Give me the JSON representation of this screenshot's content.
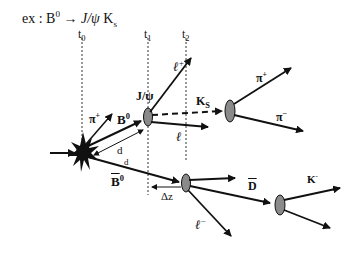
{
  "title": {
    "prefix": "ex : B",
    "sup": "0",
    "arrow": " → ",
    "jpsi": "J/ψ",
    "ks": " K",
    "ks_sub": "s"
  },
  "time_markers": [
    {
      "label": "t",
      "sub": "0"
    },
    {
      "label": "t",
      "sub": "1"
    },
    {
      "label": "t",
      "sub": "2"
    }
  ],
  "particles": {
    "b0": {
      "label": "B",
      "sup": "0"
    },
    "b0bar": {
      "label": "B",
      "sup": "0"
    },
    "pi_plus_prompt": {
      "label": "π",
      "sup": "+"
    },
    "jpsi": {
      "label": "J/ψ"
    },
    "lepton_plus": {
      "label": "ℓ",
      "sup": "+"
    },
    "lepton_minus_jpsi": {
      "label": "ℓ",
      "sup": "−"
    },
    "ks": {
      "label": "K",
      "sub": "S"
    },
    "pi_plus": {
      "label": "π",
      "sup": "+"
    },
    "pi_minus": {
      "label": "π",
      "sup": "−"
    },
    "dbar": {
      "label": "D"
    },
    "k_minus": {
      "label": "K",
      "sup": "-"
    },
    "lepton_minus": {
      "label": "ℓ",
      "sup": "−"
    }
  },
  "distances": {
    "d1": "d",
    "d2": "d",
    "dz": "Δz"
  },
  "colors": {
    "line": "#111111",
    "vertex_fill": "#8a8a8a",
    "dotted": "#333333"
  }
}
